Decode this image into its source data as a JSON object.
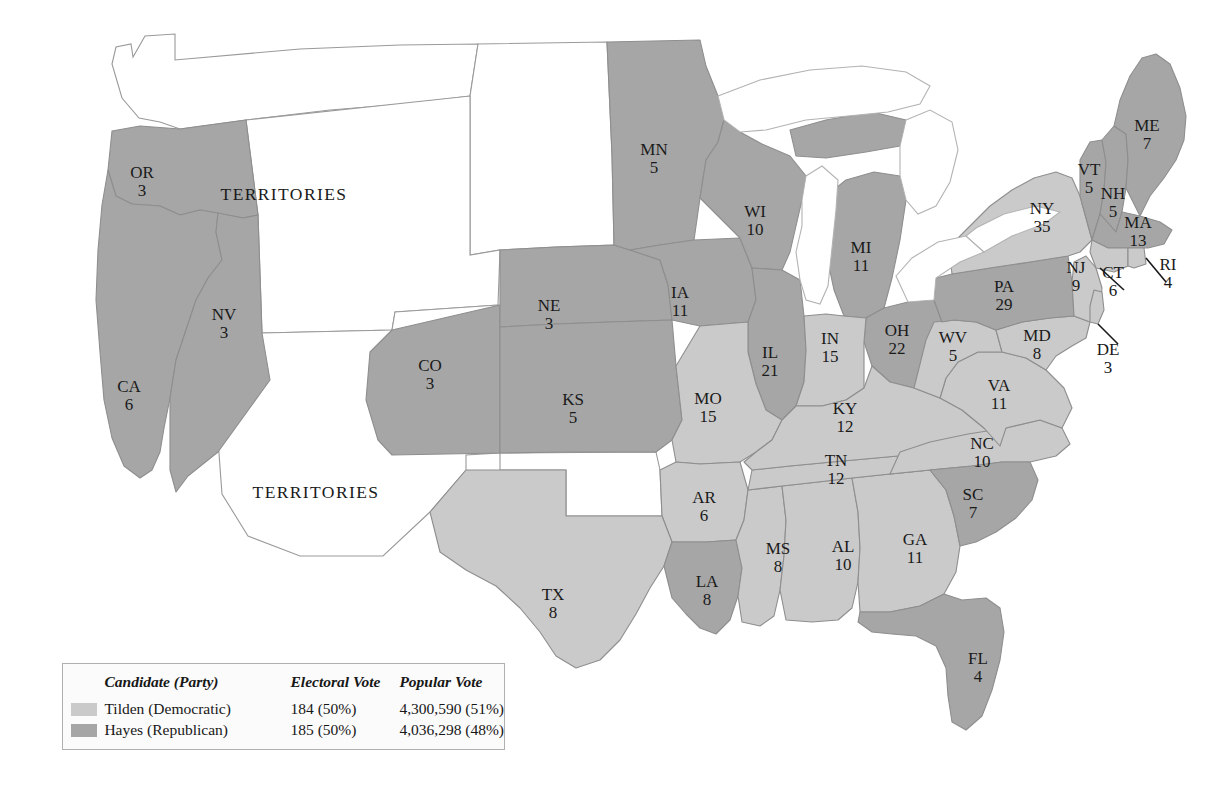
{
  "figure": {
    "territory_labels": [
      "TERRITORIES",
      "TERRITORIES"
    ]
  },
  "legend": {
    "headers": {
      "swatch": "",
      "candidate": "Candidate (Party)",
      "electoral": "Electoral Vote",
      "popular": "Popular Vote"
    },
    "rows": [
      {
        "key": "tilden",
        "candidate": "Tilden (Democratic)",
        "electoral": "184 (50%)",
        "popular": "4,300,590 (51%)",
        "color": "#cacaca"
      },
      {
        "key": "hayes",
        "candidate": "Hayes (Republican)",
        "electoral": "185 (50%)",
        "popular": "4,036,298 (48%)",
        "color": "#a6a6a6"
      }
    ]
  },
  "chart_data": {
    "type": "map",
    "title": "",
    "colors": {
      "democratic": "#cacaca",
      "republican": "#a6a6a6",
      "territory": "#ffffff"
    },
    "legend_position": "bottom-left",
    "totals": {
      "tilden_electoral": 184,
      "hayes_electoral": 185,
      "tilden_popular": 4300590,
      "hayes_popular": 4036298,
      "tilden_popular_pct": 51,
      "hayes_popular_pct": 48
    },
    "states": [
      {
        "abbr": "OR",
        "ev": "3",
        "winner": "republican",
        "x": 142,
        "y": 178
      },
      {
        "abbr": "CA",
        "ev": "6",
        "winner": "republican",
        "x": 129,
        "y": 392
      },
      {
        "abbr": "NV",
        "ev": "3",
        "winner": "republican",
        "x": 224,
        "y": 320
      },
      {
        "abbr": "CO",
        "ev": "3",
        "winner": "republican",
        "x": 430,
        "y": 371
      },
      {
        "abbr": "NE",
        "ev": "3",
        "winner": "republican",
        "x": 549,
        "y": 311
      },
      {
        "abbr": "KS",
        "ev": "5",
        "winner": "republican",
        "x": 573,
        "y": 405
      },
      {
        "abbr": "MN",
        "ev": "5",
        "winner": "republican",
        "x": 654,
        "y": 155
      },
      {
        "abbr": "IA",
        "ev": "11",
        "winner": "republican",
        "x": 680,
        "y": 298
      },
      {
        "abbr": "MO",
        "ev": "15",
        "winner": "democratic",
        "x": 708,
        "y": 404
      },
      {
        "abbr": "AR",
        "ev": "6",
        "winner": "democratic",
        "x": 704,
        "y": 503
      },
      {
        "abbr": "TX",
        "ev": "8",
        "winner": "democratic",
        "x": 553,
        "y": 600
      },
      {
        "abbr": "LA",
        "ev": "8",
        "winner": "republican",
        "x": 707,
        "y": 587
      },
      {
        "abbr": "WI",
        "ev": "10",
        "winner": "republican",
        "x": 755,
        "y": 217
      },
      {
        "abbr": "IL",
        "ev": "21",
        "winner": "republican",
        "x": 770,
        "y": 358
      },
      {
        "abbr": "MS",
        "ev": "8",
        "winner": "democratic",
        "x": 778,
        "y": 554
      },
      {
        "abbr": "MI",
        "ev": "11",
        "winner": "republican",
        "x": 861,
        "y": 253
      },
      {
        "abbr": "IN",
        "ev": "15",
        "winner": "democratic",
        "x": 830,
        "y": 344
      },
      {
        "abbr": "KY",
        "ev": "12",
        "winner": "democratic",
        "x": 845,
        "y": 414
      },
      {
        "abbr": "TN",
        "ev": "12",
        "winner": "democratic",
        "x": 836,
        "y": 466
      },
      {
        "abbr": "AL",
        "ev": "10",
        "winner": "democratic",
        "x": 843,
        "y": 552
      },
      {
        "abbr": "OH",
        "ev": "22",
        "winner": "republican",
        "x": 897,
        "y": 336
      },
      {
        "abbr": "WV",
        "ev": "5",
        "winner": "democratic",
        "x": 953,
        "y": 343
      },
      {
        "abbr": "VA",
        "ev": "11",
        "winner": "democratic",
        "x": 999,
        "y": 391
      },
      {
        "abbr": "NC",
        "ev": "10",
        "winner": "democratic",
        "x": 982,
        "y": 449
      },
      {
        "abbr": "SC",
        "ev": "7",
        "winner": "republican",
        "x": 973,
        "y": 500
      },
      {
        "abbr": "GA",
        "ev": "11",
        "winner": "democratic",
        "x": 915,
        "y": 545
      },
      {
        "abbr": "FL",
        "ev": "4",
        "winner": "republican",
        "x": 978,
        "y": 664
      },
      {
        "abbr": "PA",
        "ev": "29",
        "winner": "republican",
        "x": 1004,
        "y": 292
      },
      {
        "abbr": "NY",
        "ev": "35",
        "winner": "democratic",
        "x": 1042,
        "y": 214
      },
      {
        "abbr": "MD",
        "ev": "8",
        "winner": "democratic",
        "x": 1037,
        "y": 341
      },
      {
        "abbr": "NJ",
        "ev": "9",
        "winner": "democratic",
        "x": 1076,
        "y": 273
      },
      {
        "abbr": "DE",
        "ev": "3",
        "winner": "democratic",
        "x": 1108,
        "y": 355
      },
      {
        "abbr": "CT",
        "ev": "6",
        "winner": "democratic",
        "x": 1113,
        "y": 278
      },
      {
        "abbr": "RI",
        "ev": "4",
        "winner": "democratic",
        "x": 1168,
        "y": 270
      },
      {
        "abbr": "MA",
        "ev": "13",
        "winner": "republican",
        "x": 1138,
        "y": 228
      },
      {
        "abbr": "VT",
        "ev": "5",
        "winner": "republican",
        "x": 1089,
        "y": 175
      },
      {
        "abbr": "NH",
        "ev": "5",
        "winner": "republican",
        "x": 1113,
        "y": 199
      },
      {
        "abbr": "ME",
        "ev": "7",
        "winner": "republican",
        "x": 1147,
        "y": 131
      }
    ]
  }
}
